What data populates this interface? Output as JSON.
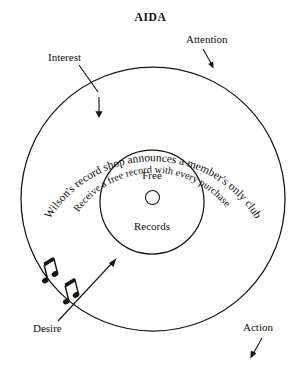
{
  "figure": {
    "title": "AIDA",
    "type": "concentric-circle-diagram",
    "background_color": "#ffffff",
    "ink_color": "#17150f"
  },
  "rings": {
    "outer_text": "Wilson's record shop announces a member's only club",
    "inner_text": "Receive a free record with every purchase"
  },
  "center": {
    "line1": "Free",
    "line2": "Records",
    "hole_icon": "record-hole-icon"
  },
  "callouts": [
    {
      "id": "attention",
      "label": "Attention",
      "marker": "arrow-down-right-icon"
    },
    {
      "id": "interest",
      "label": "Interest",
      "marker": "leader-line-icon"
    },
    {
      "id": "desire",
      "label": "Desire",
      "marker": "arrow-up-right-icon"
    },
    {
      "id": "action",
      "label": "Action",
      "marker": "arrow-down-left-icon"
    }
  ],
  "decorations": {
    "music_note_1": "music-note-icon",
    "music_note_2": "music-note-icon",
    "note_glyph": "♫"
  }
}
